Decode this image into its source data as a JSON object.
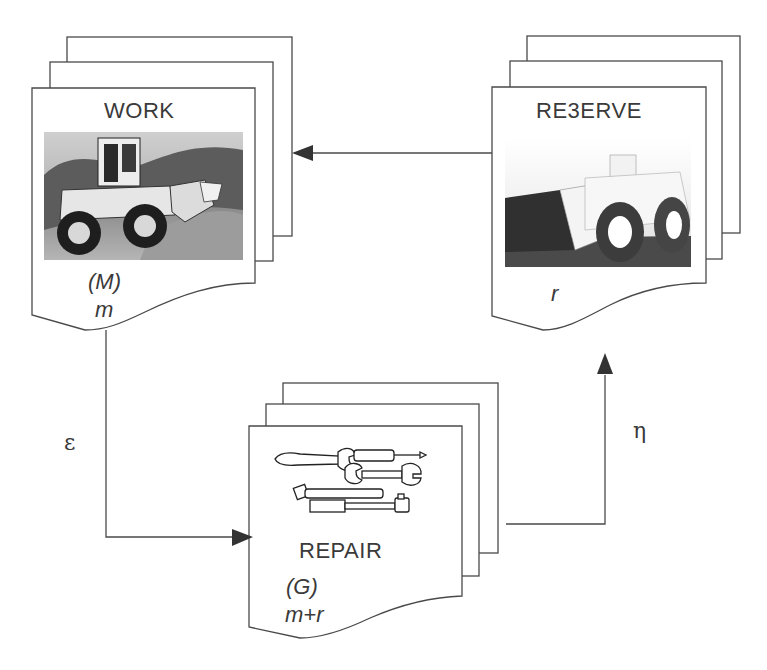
{
  "diagram": {
    "nodes": {
      "work": {
        "title": "WORK",
        "label": "(M)",
        "count": "m",
        "image": "wheel-loader-photo"
      },
      "reserve": {
        "title": "RE3ERVE",
        "count": "r",
        "image": "mining-loader-photo"
      },
      "repair": {
        "title": "REPAIR",
        "label": "(G)",
        "count": "m+r",
        "image": "tools-illustration"
      }
    },
    "edges": [
      {
        "from": "work",
        "to": "repair",
        "label": "ε"
      },
      {
        "from": "repair",
        "to": "reserve",
        "label": "η"
      },
      {
        "from": "reserve",
        "to": "work",
        "label": ""
      }
    ],
    "colors": {
      "stroke": "#4a4a4a",
      "text": "#3a3a3a",
      "background": "#ffffff"
    }
  }
}
